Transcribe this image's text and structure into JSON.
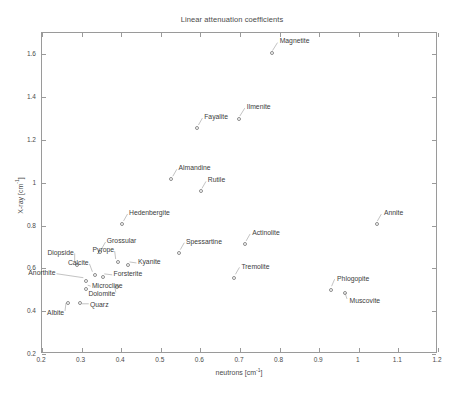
{
  "chart_data": {
    "type": "scatter",
    "title": "Linear attenuation coefficients",
    "xlabel": "neutrons [cm",
    "xlabel_exp": "-1",
    "xlabel_tail": "]",
    "ylabel": "X-ray [cm",
    "ylabel_exp": "-1",
    "ylabel_tail": "]",
    "xlim": [
      0.2,
      1.2
    ],
    "ylim": [
      0.2,
      1.7
    ],
    "xticks": [
      "0.2",
      "0.3",
      "0.4",
      "0.5",
      "0.6",
      "0.7",
      "0.8",
      "0.9",
      "1",
      "1.1",
      "1.2"
    ],
    "xtick_values": [
      0.2,
      0.3,
      0.4,
      0.5,
      0.6,
      0.7,
      0.8,
      0.9,
      1.0,
      1.1,
      1.2
    ],
    "yticks": [
      "0.2",
      "0.4",
      "0.6",
      "0.8",
      "1",
      "1.2",
      "1.4",
      "1.6"
    ],
    "ytick_values": [
      0.2,
      0.4,
      0.6,
      0.8,
      1.0,
      1.2,
      1.4,
      1.6
    ],
    "grid": false,
    "legend": false,
    "marker": "open-circle",
    "marker_color": "#8d8d8d",
    "points": [
      {
        "name": "Magnetite",
        "x": 0.78,
        "y": 1.608,
        "lx": 8,
        "ly": -11
      },
      {
        "name": "Ilmenite",
        "x": 0.697,
        "y": 1.3,
        "lx": 8,
        "ly": -11
      },
      {
        "name": "Fayalite",
        "x": 0.592,
        "y": 1.258,
        "lx": 7,
        "ly": -10
      },
      {
        "name": "Almandine",
        "x": 0.527,
        "y": 1.017,
        "lx": 7,
        "ly": -10
      },
      {
        "name": "Rutile",
        "x": 0.601,
        "y": 0.96,
        "lx": 7,
        "ly": -10
      },
      {
        "name": "Hedenbergite",
        "x": 0.402,
        "y": 0.807,
        "lx": 7,
        "ly": -10
      },
      {
        "name": "Annite",
        "x": 1.046,
        "y": 0.806,
        "lx": 7,
        "ly": -10
      },
      {
        "name": "Actinolite",
        "x": 0.713,
        "y": 0.713,
        "lx": 7,
        "ly": -10
      },
      {
        "name": "Grossular",
        "x": 0.346,
        "y": 0.675,
        "lx": 7,
        "ly": -10
      },
      {
        "name": "Spessartine",
        "x": 0.546,
        "y": 0.672,
        "lx": 7,
        "ly": -10
      },
      {
        "name": "Diopside",
        "x": 0.288,
        "y": 0.617,
        "lx": -3,
        "ly": -11
      },
      {
        "name": "Pyrope",
        "x": 0.392,
        "y": 0.628,
        "lx": -4,
        "ly": -11
      },
      {
        "name": "Kyanite",
        "x": 0.417,
        "y": 0.614,
        "lx": 10,
        "ly": -2
      },
      {
        "name": "Calcite",
        "x": 0.333,
        "y": 0.568,
        "lx": -6,
        "ly": -11
      },
      {
        "name": "Forsterite",
        "x": 0.353,
        "y": 0.558,
        "lx": 11,
        "ly": -2
      },
      {
        "name": "Tremolite",
        "x": 0.686,
        "y": 0.556,
        "lx": 7,
        "ly": -10
      },
      {
        "name": "Anorthite",
        "x": 0.31,
        "y": 0.54,
        "lx": -30,
        "ly": -7
      },
      {
        "name": "Microcline",
        "x": 0.311,
        "y": 0.505,
        "lx": 6,
        "ly": -2
      },
      {
        "name": "Dolomite",
        "x": 0.39,
        "y": 0.513,
        "lx": -2,
        "ly": 8
      },
      {
        "name": "Phlogopite",
        "x": 0.93,
        "y": 0.5,
        "lx": 6,
        "ly": -10
      },
      {
        "name": "Muscovite",
        "x": 0.964,
        "y": 0.487,
        "lx": 5,
        "ly": 9
      },
      {
        "name": "Quarz",
        "x": 0.296,
        "y": 0.436,
        "lx": 10,
        "ly": 3
      },
      {
        "name": "Albite",
        "x": 0.266,
        "y": 0.44,
        "lx": -4,
        "ly": 11
      }
    ]
  }
}
